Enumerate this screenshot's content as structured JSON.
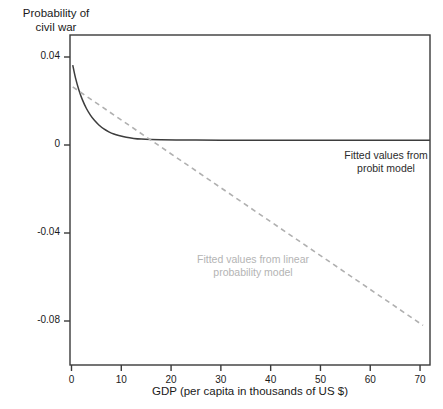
{
  "chart_data": {
    "type": "line",
    "title": "",
    "ylabel": "Probability of\ncivil war",
    "xlabel": "GDP (per capita in thousands of US $)",
    "xlim": [
      -0.3,
      72.0
    ],
    "ylim": [
      -0.1,
      0.05
    ],
    "grid": false,
    "legend_position": "in-plot annotations",
    "xticks": [
      0,
      10,
      20,
      30,
      40,
      50,
      60,
      70
    ],
    "xtick_labels": [
      "0",
      "10",
      "20",
      "30",
      "40",
      "50",
      "60",
      "70"
    ],
    "yticks": [
      0.04,
      0,
      -0.04,
      -0.08
    ],
    "ytick_labels": [
      "0.04",
      "0",
      "-0.04",
      "-0.08"
    ],
    "series": [
      {
        "name": "Fitted values from probit model",
        "style": "solid",
        "color": "#3d3d3d",
        "x": [
          0.25,
          0.8,
          1.5,
          2.2,
          3.0,
          3.8,
          4.6,
          5.5,
          6.5,
          7.5,
          8.5,
          9.5,
          11.0,
          12.5,
          14.0,
          16.0,
          18.0,
          21.0,
          25.0,
          30.0,
          36.0,
          42.0,
          50.0,
          58.0,
          66.0,
          72.0
        ],
        "y": [
          0.0363,
          0.0305,
          0.0249,
          0.0205,
          0.0166,
          0.0136,
          0.0112,
          0.0091,
          0.0073,
          0.006,
          0.005,
          0.0043,
          0.0035,
          0.003,
          0.0027,
          0.0025,
          0.0024,
          0.0023,
          0.0023,
          0.0022,
          0.0022,
          0.0022,
          0.0022,
          0.0022,
          0.0022,
          0.0022
        ]
      },
      {
        "name": "Fitted values from linear probability model",
        "style": "dashed",
        "color": "#b0b0b0",
        "x": [
          0.25,
          70.6
        ],
        "y": [
          0.0264,
          -0.082
        ]
      }
    ],
    "annotations": [
      {
        "text": "Fitted values from\nprobit model",
        "x_px": 386,
        "y_px": 162,
        "color": "#2b2b2b"
      },
      {
        "text": "Fitted values from linear\nprobability model",
        "x_px": 253,
        "y_px": 266,
        "color": "#b4b4b4"
      }
    ]
  },
  "axes": {
    "frame_color": "#3a3a3a"
  }
}
